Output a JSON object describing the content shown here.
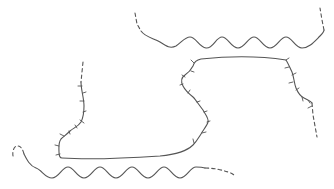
{
  "diagram": {
    "stroke_color": "#555555",
    "background": "#ffffff",
    "elements": [
      {
        "id": "top-wave",
        "type": "wavy-line",
        "ends": "dashed"
      },
      {
        "id": "bottom-wave",
        "type": "wavy-line",
        "ends": "dashed"
      },
      {
        "id": "hatched-loop",
        "type": "ticked-curve",
        "ends": "dashed"
      }
    ]
  }
}
